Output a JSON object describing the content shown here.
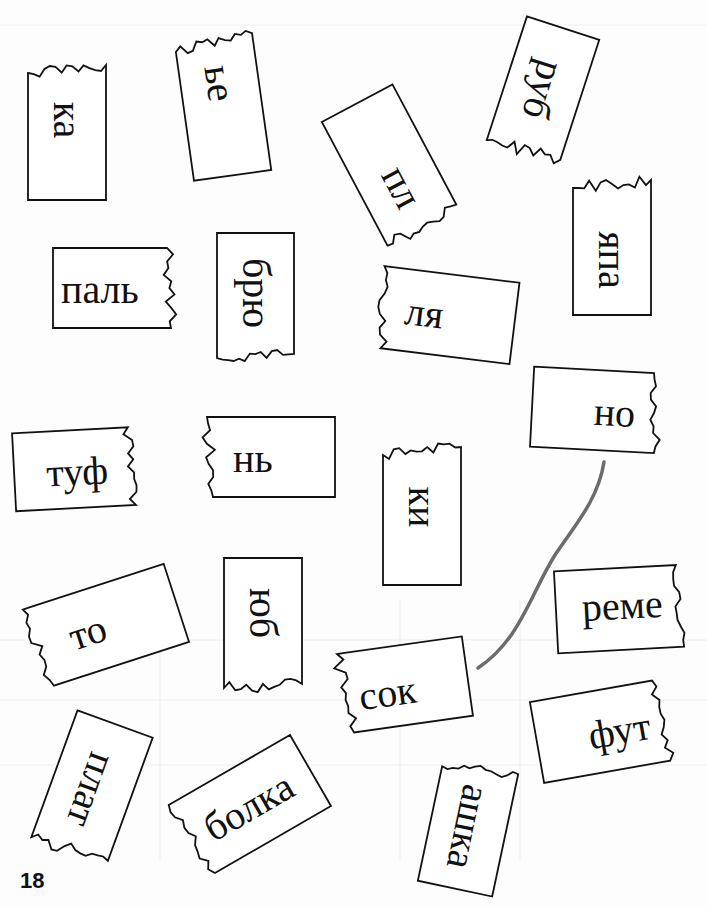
{
  "page_number": "18",
  "cards": [
    {
      "id": "ka",
      "text": "ка",
      "x": 28,
      "y": 65,
      "w": 78,
      "h": 135,
      "rot": 0,
      "text_rot": 90,
      "torn": "top",
      "tx": 39,
      "ty": 55
    },
    {
      "id": "be",
      "text": "ье",
      "x": 184,
      "y": 38,
      "w": 78,
      "h": 138,
      "rot": -8,
      "text_rot": 90,
      "torn": "top",
      "tx": 39,
      "ty": 45
    },
    {
      "id": "pl",
      "text": "пл",
      "x": 350,
      "y": 95,
      "w": 80,
      "h": 140,
      "rot": -28,
      "text_rot": 90,
      "torn": "bottom",
      "tx": 44,
      "ty": 95
    },
    {
      "id": "rub",
      "text": "руб",
      "x": 505,
      "y": 25,
      "w": 76,
      "h": 130,
      "rot": 18,
      "text_rot": 90,
      "torn": "bottom",
      "tx": 38,
      "ty": 65
    },
    {
      "id": "yapa",
      "text": "япа",
      "x": 573,
      "y": 180,
      "w": 78,
      "h": 135,
      "rot": 0,
      "text_rot": 90,
      "torn": "top",
      "tx": 39,
      "ty": 80
    },
    {
      "id": "pal",
      "text": "паль",
      "x": 53,
      "y": 248,
      "w": 122,
      "h": 80,
      "rot": 0,
      "text_rot": 0,
      "torn": "right",
      "tx": 8,
      "ty": 22
    },
    {
      "id": "bryu",
      "text": "брю",
      "x": 217,
      "y": 233,
      "w": 77,
      "h": 125,
      "rot": 0,
      "text_rot": 90,
      "torn": "bottom",
      "tx": 38,
      "ty": 60
    },
    {
      "id": "lya",
      "text": "ля",
      "x": 377,
      "y": 274,
      "w": 138,
      "h": 82,
      "rot": 7,
      "text_rot": 0,
      "torn": "left",
      "tx": 28,
      "ty": 22
    },
    {
      "id": "no",
      "text": "но",
      "x": 532,
      "y": 370,
      "w": 128,
      "h": 80,
      "rot": 3,
      "text_rot": 0,
      "torn": "right",
      "tx": 62,
      "ty": 22
    },
    {
      "id": "tuf",
      "text": "туф",
      "x": 14,
      "y": 430,
      "w": 124,
      "h": 78,
      "rot": -3,
      "text_rot": 0,
      "torn": "right",
      "tx": 32,
      "ty": 22
    },
    {
      "id": "n",
      "text": "нь",
      "x": 205,
      "y": 417,
      "w": 130,
      "h": 80,
      "rot": 0,
      "text_rot": 0,
      "torn": "left",
      "tx": 28,
      "ty": 22
    },
    {
      "id": "ki",
      "text": "ки",
      "x": 383,
      "y": 447,
      "w": 78,
      "h": 138,
      "rot": 0,
      "text_rot": 90,
      "torn": "top",
      "tx": 39,
      "ty": 60
    },
    {
      "id": "to",
      "text": "то",
      "x": 30,
      "y": 585,
      "w": 150,
      "h": 82,
      "rot": -18,
      "text_rot": 0,
      "torn": "left",
      "tx": 38,
      "ty": 22
    },
    {
      "id": "yub",
      "text": "юб",
      "x": 224,
      "y": 558,
      "w": 78,
      "h": 130,
      "rot": 0,
      "text_rot": 90,
      "torn": "bottom",
      "tx": 38,
      "ty": 55
    },
    {
      "id": "sok",
      "text": "сок",
      "x": 340,
      "y": 645,
      "w": 128,
      "h": 80,
      "rot": -8,
      "text_rot": 0,
      "torn": "left",
      "tx": 18,
      "ty": 26
    },
    {
      "id": "reme",
      "text": "реме",
      "x": 556,
      "y": 568,
      "w": 130,
      "h": 82,
      "rot": -3,
      "text_rot": 0,
      "torn": "right",
      "tx": 26,
      "ty": 18
    },
    {
      "id": "fut",
      "text": "фут",
      "x": 536,
      "y": 690,
      "w": 132,
      "h": 82,
      "rot": -10,
      "text_rot": 0,
      "torn": "right",
      "tx": 52,
      "ty": 24
    },
    {
      "id": "plat",
      "text": "плат",
      "x": 52,
      "y": 720,
      "w": 80,
      "h": 135,
      "rot": 20,
      "text_rot": 90,
      "torn": "bottom",
      "tx": 40,
      "ty": 70
    },
    {
      "id": "bolka",
      "text": "болка",
      "x": 178,
      "y": 765,
      "w": 142,
      "h": 82,
      "rot": -30,
      "text_rot": 0,
      "torn": "left",
      "tx": 22,
      "ty": 22
    },
    {
      "id": "ashka",
      "text": "ашка",
      "x": 430,
      "y": 765,
      "w": 76,
      "h": 125,
      "rot": 12,
      "text_rot": 90,
      "torn": "top",
      "tx": 38,
      "ty": 62
    }
  ],
  "connector": {
    "from": "no",
    "to": "sok",
    "color": "#6b6b6b"
  }
}
